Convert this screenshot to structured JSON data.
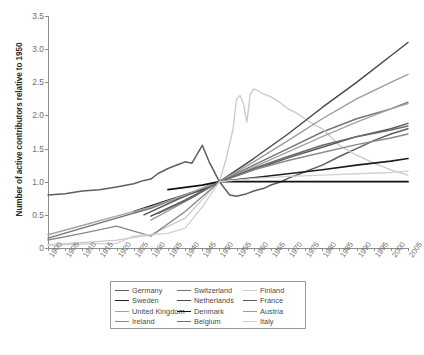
{
  "chart_data": {
    "type": "line",
    "title": "",
    "xlabel": "",
    "ylabel": "Number of active contributors relative to 1950",
    "xlim": [
      1900,
      2005
    ],
    "ylim": [
      0,
      3.5
    ],
    "ytick_labels": [
      "0",
      "0.5",
      "1.0",
      "1.5",
      "2.0",
      "2.5",
      "3.0",
      "3.5"
    ],
    "ytick_values": [
      0,
      0.5,
      1.0,
      1.5,
      2.0,
      2.5,
      3.0,
      3.5
    ],
    "xtick_labels": [
      "1900",
      "1905",
      "1910",
      "1915",
      "1920",
      "1925",
      "1930",
      "1935",
      "1940",
      "1945",
      "1950",
      "1955",
      "1960",
      "1965",
      "1970",
      "1975",
      "1980",
      "1985",
      "1990",
      "1995",
      "2000",
      "2005"
    ],
    "xtick_values": [
      1900,
      1905,
      1910,
      1915,
      1920,
      1925,
      1930,
      1935,
      1940,
      1945,
      1950,
      1955,
      1960,
      1965,
      1970,
      1975,
      1980,
      1985,
      1990,
      1995,
      2000,
      2005
    ],
    "grid": false,
    "legend_position": "bottom",
    "legend_columns": 3,
    "normalization_year": 1950,
    "normalization_value": 1.0,
    "series": [
      {
        "name": "Germany",
        "color": "#5e5e5e",
        "width": 1.5,
        "x": [
          1900,
          1905,
          1910,
          1915,
          1920,
          1925,
          1928,
          1930,
          1932,
          1935,
          1938,
          1940,
          1942,
          1945,
          1947,
          1950,
          1953,
          1955,
          1958,
          1960,
          1963,
          1965,
          1968,
          1970,
          1975,
          1980,
          1985,
          1990,
          1995,
          2000,
          2005
        ],
        "y": [
          0.8,
          0.82,
          0.86,
          0.88,
          0.92,
          0.97,
          1.02,
          1.04,
          1.12,
          1.2,
          1.26,
          1.3,
          1.28,
          1.55,
          1.3,
          1.0,
          0.8,
          0.78,
          0.82,
          0.86,
          0.9,
          0.95,
          1.0,
          1.05,
          1.15,
          1.25,
          1.38,
          1.5,
          1.62,
          1.72,
          1.8
        ]
      },
      {
        "name": "Switzerland",
        "color": "#747474",
        "width": 1.4,
        "x": [
          1900,
          1910,
          1920,
          1930,
          1940,
          1950,
          1960,
          1970,
          1980,
          1990,
          2000,
          2005
        ],
        "y": [
          0.15,
          0.3,
          0.45,
          0.6,
          0.8,
          1.0,
          1.25,
          1.5,
          1.75,
          1.95,
          2.1,
          2.2
        ]
      },
      {
        "name": "Finland",
        "color": "#c9c9c9",
        "width": 1.3,
        "x": [
          1900,
          1910,
          1920,
          1930,
          1940,
          1948,
          1950,
          1952,
          1954,
          1955,
          1956,
          1957,
          1958,
          1959,
          1960,
          1961,
          1963,
          1965,
          1967,
          1970,
          1972,
          1975,
          1978,
          1980,
          1985,
          1990,
          1995,
          2000,
          2005
        ],
        "y": [
          0.05,
          0.08,
          0.12,
          0.2,
          0.45,
          0.9,
          1.0,
          1.35,
          1.8,
          2.25,
          2.3,
          2.18,
          1.9,
          2.32,
          2.4,
          2.38,
          2.32,
          2.28,
          2.22,
          2.1,
          2.05,
          1.95,
          1.85,
          1.8,
          1.55,
          1.4,
          1.28,
          1.18,
          1.1
        ]
      },
      {
        "name": "Sweden",
        "color": "#1f1f1f",
        "width": 1.7,
        "x": [
          1925,
          1935,
          1945,
          1950,
          1960,
          1970,
          1980,
          1990,
          2000,
          2005
        ],
        "y": [
          0.55,
          0.72,
          0.88,
          1.0,
          1.06,
          1.12,
          1.18,
          1.25,
          1.31,
          1.35
        ]
      },
      {
        "name": "Netherlands",
        "color": "#4a4a4a",
        "width": 1.5,
        "x": [
          1930,
          1940,
          1950,
          1960,
          1970,
          1980,
          1990,
          2000,
          2005
        ],
        "y": [
          0.48,
          0.72,
          1.0,
          1.35,
          1.72,
          2.12,
          2.5,
          2.9,
          3.1
        ]
      },
      {
        "name": "France",
        "color": "#5a5a5a",
        "width": 1.5,
        "x": [
          1928,
          1938,
          1950,
          1960,
          1970,
          1980,
          1990,
          2000,
          2005
        ],
        "y": [
          0.5,
          0.74,
          1.0,
          1.18,
          1.36,
          1.52,
          1.68,
          1.8,
          1.88
        ]
      },
      {
        "name": "United Kingdom",
        "color": "#a3a3a3",
        "width": 1.4,
        "x": [
          1900,
          1910,
          1920,
          1930,
          1940,
          1950,
          1960,
          1970,
          1980,
          1990,
          2000,
          2005
        ],
        "y": [
          0.2,
          0.34,
          0.48,
          0.62,
          0.8,
          1.0,
          1.22,
          1.45,
          1.68,
          1.9,
          2.1,
          2.18
        ]
      },
      {
        "name": "Denmark",
        "color": "#111111",
        "width": 1.8,
        "x": [
          1935,
          1945,
          1950,
          1960,
          1970,
          1980,
          1990,
          2000,
          2005
        ],
        "y": [
          0.88,
          0.95,
          1.0,
          1.0,
          1.0,
          1.0,
          1.0,
          1.0,
          1.0
        ]
      },
      {
        "name": "Austria",
        "color": "#9b9b9b",
        "width": 1.4,
        "x": [
          1930,
          1940,
          1950,
          1960,
          1970,
          1980,
          1990,
          2000,
          2005
        ],
        "y": [
          0.42,
          0.7,
          1.0,
          1.3,
          1.62,
          1.95,
          2.25,
          2.5,
          2.62
        ]
      },
      {
        "name": "Ireland",
        "color": "#8a8a8a",
        "width": 1.4,
        "x": [
          1900,
          1910,
          1920,
          1930,
          1940,
          1950,
          1960,
          1970,
          1980,
          1990,
          2000,
          2005
        ],
        "y": [
          0.12,
          0.22,
          0.33,
          0.18,
          0.55,
          1.0,
          1.18,
          1.32,
          1.44,
          1.56,
          1.66,
          1.72
        ]
      },
      {
        "name": "Belgium",
        "color": "#6b6b6b",
        "width": 1.5,
        "x": [
          1932,
          1942,
          1950,
          1960,
          1970,
          1980,
          1990,
          2000,
          2005
        ],
        "y": [
          0.52,
          0.76,
          1.0,
          1.2,
          1.38,
          1.55,
          1.68,
          1.78,
          1.84
        ]
      },
      {
        "name": "Italy",
        "color": "#d2d2d2",
        "width": 1.4,
        "x": [
          1900,
          1910,
          1920,
          1925,
          1930,
          1935,
          1940,
          1945,
          1950,
          1960,
          1970,
          1980,
          1990,
          2000,
          2005
        ],
        "y": [
          0.04,
          0.06,
          0.07,
          0.18,
          0.2,
          0.22,
          0.3,
          0.62,
          1.0,
          1.05,
          1.08,
          1.1,
          1.12,
          1.14,
          1.16
        ]
      }
    ]
  },
  "legend": {
    "items": [
      {
        "label": "Germany",
        "color": "#5e5e5e",
        "width": 1.5
      },
      {
        "label": "Switzerland",
        "color": "#747474",
        "width": 1.4
      },
      {
        "label": "Finland",
        "color": "#c9c9c9",
        "width": 1.3
      },
      {
        "label": "Sweden",
        "color": "#1f1f1f",
        "width": 1.7
      },
      {
        "label": "Netherlands",
        "color": "#4a4a4a",
        "width": 1.5
      },
      {
        "label": "France",
        "color": "#5a5a5a",
        "width": 1.5
      },
      {
        "label": "United Kingdom",
        "color": "#a3a3a3",
        "width": 1.4
      },
      {
        "label": "Denmark",
        "color": "#111111",
        "width": 1.8
      },
      {
        "label": "Austria",
        "color": "#9b9b9b",
        "width": 1.4
      },
      {
        "label": "Ireland",
        "color": "#8a8a8a",
        "width": 1.4
      },
      {
        "label": "Belgium",
        "color": "#6b6b6b",
        "width": 1.5
      },
      {
        "label": "Italy",
        "color": "#d2d2d2",
        "width": 1.4
      }
    ]
  },
  "colors": {
    "axis": "#8d8d8d",
    "tick_text": "#6e6e6e",
    "title_text": "#2b2b2b",
    "legend_border": "#9a9a9a",
    "background": "#ffffff"
  }
}
